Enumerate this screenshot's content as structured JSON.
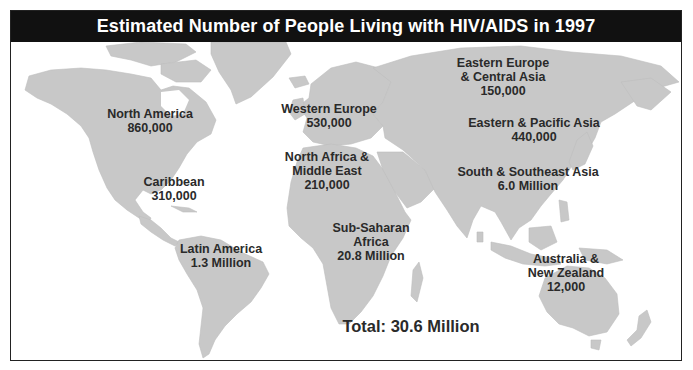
{
  "title": "Estimated Number of People Living with HIV/AIDS in 1997",
  "colors": {
    "title_bar_bg": "#111111",
    "title_text": "#ffffff",
    "land": "#c8c8c8",
    "ocean": "#ffffff",
    "label_text": "#2a2a2a"
  },
  "regions": [
    {
      "id": "north-america",
      "name": "North America",
      "name_lines": [
        "North America"
      ],
      "value": "860,000"
    },
    {
      "id": "caribbean",
      "name": "Caribbean",
      "name_lines": [
        "Caribbean"
      ],
      "value": "310,000"
    },
    {
      "id": "latin-america",
      "name": "Latin America",
      "name_lines": [
        "Latin America"
      ],
      "value": "1.3 Million"
    },
    {
      "id": "western-europe",
      "name": "Western Europe",
      "name_lines": [
        "Western Europe"
      ],
      "value": "530,000"
    },
    {
      "id": "north-africa-middle-east",
      "name": "North Africa & Middle East",
      "name_lines": [
        "North Africa &",
        "Middle East"
      ],
      "value": "210,000"
    },
    {
      "id": "sub-saharan-africa",
      "name": "Sub-Saharan Africa",
      "name_lines": [
        "Sub-Saharan",
        "Africa"
      ],
      "value": "20.8 Million"
    },
    {
      "id": "eastern-europe-central-asia",
      "name": "Eastern Europe & Central Asia",
      "name_lines": [
        "Eastern Europe",
        "& Central Asia"
      ],
      "value": "150,000"
    },
    {
      "id": "eastern-pacific-asia",
      "name": "Eastern & Pacific Asia",
      "name_lines": [
        "Eastern & Pacific Asia"
      ],
      "value": "440,000"
    },
    {
      "id": "south-southeast-asia",
      "name": "South & Southeast Asia",
      "name_lines": [
        "South & Southeast Asia"
      ],
      "value": "6.0 Million"
    },
    {
      "id": "australia-new-zealand",
      "name": "Australia & New Zealand",
      "name_lines": [
        "Australia &",
        "New Zealand"
      ],
      "value": "12,000"
    }
  ],
  "total": {
    "label": "Total:",
    "value": "30.6 Million",
    "text": "Total: 30.6 Million"
  }
}
